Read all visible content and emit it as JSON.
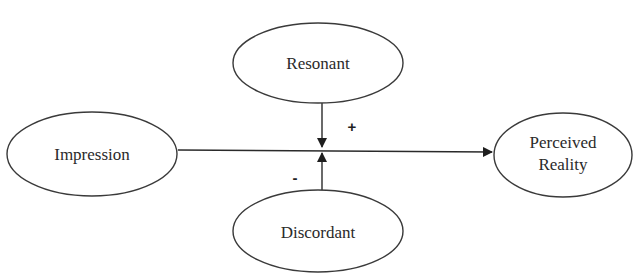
{
  "diagram": {
    "nodes": {
      "impression": {
        "label": "Impression"
      },
      "resonant": {
        "label": "Resonant"
      },
      "discordant": {
        "label": "Discordant"
      },
      "perceived_reality": {
        "label_line1": "Perceived",
        "label_line2": "Reality"
      }
    },
    "edges": [
      {
        "from": "Impression",
        "to": "Perceived Reality"
      },
      {
        "from": "Resonant",
        "to": "Impression → Perceived Reality",
        "sign": "+"
      },
      {
        "from": "Discordant",
        "to": "Impression → Perceived Reality",
        "sign": "-"
      }
    ],
    "signs": {
      "positive": "+",
      "negative": "-"
    }
  }
}
